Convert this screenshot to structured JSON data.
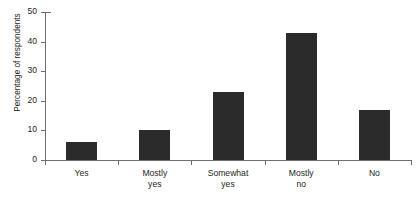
{
  "chart_data": {
    "type": "bar",
    "title": "",
    "xlabel": "",
    "ylabel": "Percentage of respondents",
    "categories": [
      "Yes",
      "Mostly yes",
      "Somewhat yes",
      "Mostly no",
      "No"
    ],
    "category_lines": [
      [
        "Yes"
      ],
      [
        "Mostly",
        "yes"
      ],
      [
        "Somewhat",
        "yes"
      ],
      [
        "Mostly",
        "no"
      ],
      [
        "No"
      ]
    ],
    "values": [
      6,
      10,
      23,
      43,
      17
    ],
    "ylim": [
      0,
      50
    ],
    "yticks": [
      0,
      10,
      20,
      30,
      40,
      50
    ],
    "ytick_labels": [
      "0",
      "10",
      "20",
      "30",
      "40",
      "50"
    ],
    "grid": false,
    "legend": null,
    "bar_color": "#2b2b2b",
    "axis_color": "#6f6f6f",
    "background": "#ffffff"
  }
}
